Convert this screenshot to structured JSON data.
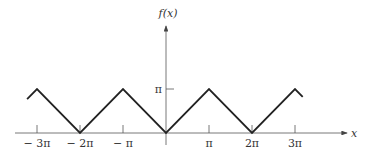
{
  "chart_data": {
    "type": "line",
    "title": "",
    "xlabel": "x",
    "ylabel": "f(x)",
    "x_ticks": [
      {
        "value": -3,
        "label": "− 3π"
      },
      {
        "value": -2,
        "label": "− 2π"
      },
      {
        "value": -1,
        "label": "− π"
      },
      {
        "value": 1,
        "label": "π"
      },
      {
        "value": 2,
        "label": "2π"
      },
      {
        "value": 3,
        "label": "3π"
      }
    ],
    "y_ticks": [
      {
        "value": 1,
        "label": "π"
      }
    ],
    "x_units": "π",
    "y_units": "π",
    "series": [
      {
        "name": "f(x)",
        "x": [
          -3.23,
          -3,
          -2,
          -1,
          0,
          1,
          2,
          3,
          3.18
        ],
        "y": [
          0.77,
          1,
          0,
          1,
          0,
          1,
          0,
          1,
          0.82
        ]
      }
    ],
    "xlim": [
      -3.5,
      4.2
    ],
    "ylim": [
      0,
      2.4
    ],
    "grid": false,
    "legend": null
  }
}
